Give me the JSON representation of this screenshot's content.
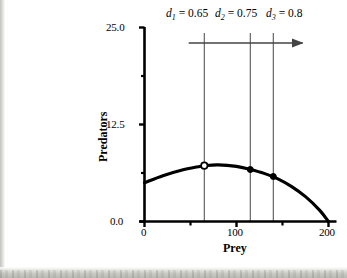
{
  "figure": {
    "name": "predator-prey-isocline-figure",
    "background_color": "#ffffff",
    "ink_color": "#000000",
    "guide_color": "#555555"
  },
  "chart_data": {
    "type": "line",
    "title": "",
    "xlabel": "Prey",
    "ylabel": "Predators",
    "xlim": [
      0,
      200
    ],
    "ylim": [
      0.0,
      25.0
    ],
    "grid": false,
    "legend_position": "none",
    "x_tick_labels": [
      "0",
      "100",
      "200"
    ],
    "x_tick_values": [
      0,
      100,
      200
    ],
    "x_minor_tick_values": [
      50,
      150
    ],
    "y_tick_labels": [
      "0.0",
      "12.5",
      "25.0"
    ],
    "y_tick_values": [
      0.0,
      12.5,
      25.0
    ],
    "y_minor_tick_values": [
      6.25,
      18.75
    ],
    "series": [
      {
        "name": "prey-isocline",
        "style": "solid-thick-curve",
        "points": [
          {
            "x": 0,
            "y": 5.0
          },
          {
            "x": 20,
            "y": 5.9
          },
          {
            "x": 40,
            "y": 6.6
          },
          {
            "x": 60,
            "y": 7.1
          },
          {
            "x": 65,
            "y": 7.2
          },
          {
            "x": 80,
            "y": 7.3
          },
          {
            "x": 100,
            "y": 7.1
          },
          {
            "x": 115,
            "y": 6.7
          },
          {
            "x": 130,
            "y": 6.2
          },
          {
            "x": 145,
            "y": 5.5
          },
          {
            "x": 160,
            "y": 4.5
          },
          {
            "x": 175,
            "y": 3.2
          },
          {
            "x": 190,
            "y": 1.5
          },
          {
            "x": 200,
            "y": 0.0
          }
        ]
      }
    ],
    "annotations": {
      "vertical_lines": [
        {
          "id": "d1",
          "label": "d",
          "subscript": "1",
          "equals": "=",
          "value": "0.65",
          "x": 65,
          "marker": "open-circle",
          "marker_y": 7.2
        },
        {
          "id": "d2",
          "label": "d",
          "subscript": "2",
          "equals": "=",
          "value": "0.75",
          "x": 115,
          "marker": "filled-circle",
          "marker_y": 6.7
        },
        {
          "id": "d3",
          "label": "d",
          "subscript": "3",
          "equals": "=",
          "value": "0.8",
          "x": 140,
          "marker": "filled-circle",
          "marker_y": 5.8
        }
      ],
      "arrow": {
        "name": "direction-arrow",
        "direction": "right",
        "x_start": 48,
        "x_end": 172,
        "y": 23.0
      }
    }
  },
  "labels": {
    "d1_text": "0.65",
    "d2_text": "0.75",
    "d3_text": "0.8",
    "d_symbol": "d",
    "equals": "=",
    "sub1": "1",
    "sub2": "2",
    "sub3": "3",
    "y_title": "Predators",
    "x_title": "Prey",
    "y_tick_0": "0.0",
    "y_tick_1": "12.5",
    "y_tick_2": "25.0",
    "x_tick_0": "0",
    "x_tick_1": "100",
    "x_tick_2": "200"
  }
}
